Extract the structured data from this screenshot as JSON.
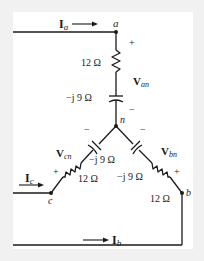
{
  "diagram": {
    "type": "three-phase Y-connected load circuit",
    "colors": {
      "wire": "#1a1a1a",
      "background": "#ffffff",
      "frame": "#f1f1f1"
    },
    "nodes": {
      "a": "a",
      "b": "b",
      "c": "c",
      "n": "n"
    },
    "currents": {
      "Ia": {
        "main": "I",
        "sub": "a"
      },
      "Ib": {
        "main": "I",
        "sub": "b"
      },
      "Ic": {
        "main": "I",
        "sub": "c"
      }
    },
    "voltages": {
      "Van": {
        "main": "V",
        "sub": "an",
        "plus": "+",
        "minus": "−"
      },
      "Vbn": {
        "main": "V",
        "sub": "bn",
        "plus": "+",
        "minus": "−"
      },
      "Vcn": {
        "main": "V",
        "sub": "cn",
        "plus": "+",
        "minus": "−"
      }
    },
    "branches": {
      "a": {
        "resistor": "12 Ω",
        "capacitor": "−j 9 Ω"
      },
      "b": {
        "resistor": "12 Ω",
        "capacitor": "−j 9 Ω"
      },
      "c": {
        "resistor": "12 Ω",
        "capacitor": "−j 9 Ω"
      }
    }
  }
}
